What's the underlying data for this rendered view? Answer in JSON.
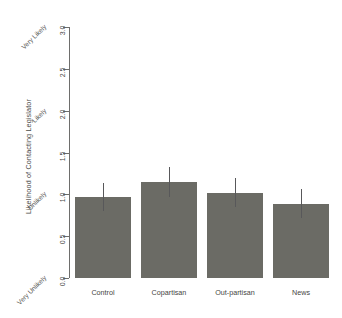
{
  "chart_data": {
    "type": "bar",
    "title": "",
    "xlabel": "",
    "ylabel": "Likelihood of Contacting Legislator",
    "categories": [
      "Control",
      "Copartisan",
      "Out-partisan",
      "News"
    ],
    "values": [
      0.97,
      1.15,
      1.02,
      0.89
    ],
    "errors": [
      0.17,
      0.18,
      0.17,
      0.17
    ],
    "error_low": [
      0.8,
      0.97,
      0.85,
      0.72
    ],
    "error_high": [
      1.14,
      1.33,
      1.19,
      1.06
    ],
    "ylim": [
      0.0,
      3.0
    ],
    "ytick_values": [
      "0.0",
      "0.5",
      "1.0",
      "1.5",
      "2.0",
      "2.5",
      "3.0"
    ],
    "yanchor_labels": [
      {
        "value": "0.0",
        "label": "Very Unlikely"
      },
      {
        "value": "1.0",
        "label": "Unlikely"
      },
      {
        "value": "2.0",
        "label": "Likely"
      },
      {
        "value": "3.0",
        "label": "Very Likely"
      }
    ],
    "grid": false,
    "legend": "none",
    "bar_color": "#6b6b65",
    "error_color": "#58585a",
    "axis_color": "#6e6e6c"
  },
  "axis": {
    "y_title": "Likelihood of Contacting Legislator",
    "ticks": [
      {
        "label": "0.0"
      },
      {
        "label": "0.5"
      },
      {
        "label": "1.0"
      },
      {
        "label": "1.5"
      },
      {
        "label": "2.0"
      },
      {
        "label": "2.5"
      },
      {
        "label": "3.0"
      }
    ],
    "anchors": [
      {
        "label": "Very Unlikely"
      },
      {
        "label": "Unlikely"
      },
      {
        "label": "Likely"
      },
      {
        "label": "Very Likely"
      }
    ]
  },
  "bars": [
    {
      "category": "Control",
      "value": "0.97"
    },
    {
      "category": "Copartisan",
      "value": "1.15"
    },
    {
      "category": "Out-partisan",
      "value": "1.02"
    },
    {
      "category": "News",
      "value": "0.89"
    }
  ]
}
